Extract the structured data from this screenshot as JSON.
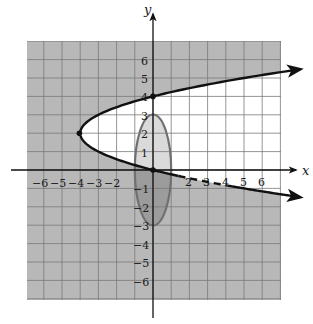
{
  "chart_data": {
    "type": "line",
    "title": "",
    "xlabel": "x",
    "ylabel": "y",
    "xlim": [
      -7,
      7
    ],
    "ylim": [
      -7,
      7
    ],
    "grid": true,
    "x_ticks": [
      "-6",
      "-5",
      "-4",
      "-3",
      "-2",
      "2",
      "3",
      "4",
      "5",
      "6"
    ],
    "y_ticks": [
      "6",
      "5",
      "4",
      "3",
      "2",
      "1",
      "-1",
      "-2",
      "-3",
      "-4",
      "-5",
      "-6"
    ],
    "x_tick_values": [
      -6,
      -5,
      -4,
      -3,
      -2,
      2,
      3,
      4,
      5,
      6
    ],
    "y_tick_values": [
      6,
      5,
      4,
      3,
      2,
      1,
      -1,
      -2,
      -3,
      -4,
      -5,
      -6
    ],
    "series": [
      {
        "name": "parabola",
        "equation": "x = (y - 2)^2 - 4",
        "vertex": [
          -4,
          2
        ],
        "points": [
          [
            -4,
            2
          ],
          [
            0,
            4
          ],
          [
            0,
            0
          ],
          [
            8,
            5.46
          ],
          [
            8,
            -1.46
          ]
        ],
        "style": "solid black; lower branch dashed between x=1.5 and x=4",
        "arrows": true
      },
      {
        "name": "ellipse",
        "equation": "x^2 + y^2/9 = 1",
        "center": [
          0,
          0
        ],
        "semi_axes": [
          1,
          3
        ],
        "style": "gray outline"
      }
    ],
    "marked_points": [
      [
        0,
        4
      ],
      [
        -4,
        2
      ],
      [
        0,
        0
      ]
    ],
    "shading": {
      "outside_parabola": "gray",
      "inside_parabola": "white",
      "ellipse_inside_parabola": "light gray",
      "ellipse_outside_parabola": "darker gray"
    }
  },
  "labels": {
    "x_axis": "x",
    "y_axis": "y",
    "x_ticks": [
      "−6",
      "−5",
      "−4",
      "−3",
      "−2",
      "2",
      "3",
      "4",
      "5",
      "6"
    ],
    "y_ticks_pos": [
      "6",
      "5",
      "4",
      "3",
      "2",
      "1"
    ],
    "y_ticks_neg": [
      "−1",
      "−2",
      "−3",
      "−4",
      "−5",
      "−6"
    ]
  },
  "colors": {
    "grid_fill_dark": "#b8b8b8",
    "grid_fill_white": "#ffffff",
    "grid_line": "#6e6e6e",
    "grid_line_white": "#9a9a9a",
    "ellipse_light": "#dadada",
    "ellipse_dark": "#9c9c9c",
    "ellipse_stroke": "#707070",
    "curve": "#111111"
  }
}
